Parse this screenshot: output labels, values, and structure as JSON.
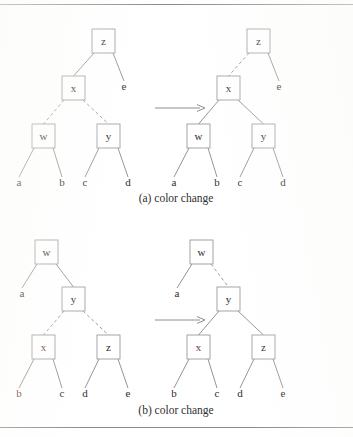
{
  "figure": {
    "rules": [
      {
        "name": "top-rule",
        "y": 4.5
      },
      {
        "name": "bottom-rule",
        "y": 427.5
      }
    ],
    "colors": {
      "page_background": "#ffffff",
      "box_stroke": "#9a9a9a",
      "box_fill": "#ffffff",
      "black_edge": "#8d8d8d",
      "red_edge": "#a08f8f",
      "label_text": "#2e2a2a",
      "red_label_text": "#6a3a38",
      "caption_text": "#2f2f2f",
      "rule_stroke": "#8a8a8a"
    },
    "box": {
      "width": 23,
      "height": 24
    },
    "arrow_glyph": "⟶"
  },
  "panels": [
    {
      "id": "panel-a",
      "caption": "(a) color change",
      "caption_x": 176,
      "caption_y": 202,
      "arrow": {
        "name": "transform-arrow-a",
        "x1": 155,
        "x2": 205,
        "y": 108
      },
      "trees": [
        {
          "id": "tree-a-before",
          "side": "before",
          "nodes": [
            {
              "label": "z",
              "x": 92,
              "y": 29,
              "red": false
            },
            {
              "label": "x",
              "x": 62,
              "y": 76,
              "red": false
            },
            {
              "label": "w",
              "x": 32,
              "y": 124,
              "red": false
            },
            {
              "label": "y",
              "x": 97,
              "y": 124,
              "red": false
            }
          ],
          "leaves": [
            {
              "label": "a",
              "x": 19,
              "y": 186,
              "red": false
            },
            {
              "label": "b",
              "x": 62,
              "y": 186,
              "red": false
            },
            {
              "label": "c",
              "x": 85,
              "y": 186,
              "red": false
            },
            {
              "label": "d",
              "x": 128,
              "y": 186,
              "red": false
            }
          ],
          "edges": [
            {
              "from": "z",
              "to": "x",
              "style": "solid"
            },
            {
              "from": "z",
              "to": "e",
              "style": "solid"
            },
            {
              "from": "x",
              "to": "w",
              "style": "dashed"
            },
            {
              "from": "x",
              "to": "y",
              "style": "dashed"
            },
            {
              "from": "w",
              "to": "a",
              "style": "solid"
            },
            {
              "from": "w",
              "to": "b",
              "style": "solid"
            },
            {
              "from": "y",
              "to": "c",
              "style": "solid"
            },
            {
              "from": "y",
              "to": "d",
              "style": "solid"
            }
          ],
          "extra_leaf": {
            "label": "e",
            "x": 124,
            "y": 90,
            "red": false
          }
        },
        {
          "id": "tree-a-after",
          "side": "after",
          "nodes": [
            {
              "label": "z",
              "x": 247,
              "y": 29,
              "red": false
            },
            {
              "label": "x",
              "x": 217,
              "y": 76,
              "red": false
            },
            {
              "label": "w",
              "x": 187,
              "y": 124,
              "red": false
            },
            {
              "label": "y",
              "x": 252,
              "y": 124,
              "red": false
            }
          ],
          "leaves": [
            {
              "label": "a",
              "x": 174,
              "y": 186,
              "red": false
            },
            {
              "label": "b",
              "x": 217,
              "y": 186,
              "red": false
            },
            {
              "label": "c",
              "x": 240,
              "y": 186,
              "red": false
            },
            {
              "label": "d",
              "x": 283,
              "y": 186,
              "red": false
            }
          ],
          "edges": [
            {
              "from": "z",
              "to": "x",
              "style": "dashed"
            },
            {
              "from": "z",
              "to": "e",
              "style": "solid"
            },
            {
              "from": "x",
              "to": "w",
              "style": "solid"
            },
            {
              "from": "x",
              "to": "y",
              "style": "solid"
            },
            {
              "from": "w",
              "to": "a",
              "style": "solid"
            },
            {
              "from": "w",
              "to": "b",
              "style": "solid"
            },
            {
              "from": "y",
              "to": "c",
              "style": "solid"
            },
            {
              "from": "y",
              "to": "d",
              "style": "solid"
            }
          ],
          "extra_leaf": {
            "label": "e",
            "x": 279,
            "y": 90,
            "red": false
          }
        }
      ]
    },
    {
      "id": "panel-b",
      "caption": "(b) color change",
      "caption_x": 176,
      "caption_y": 414,
      "arrow": {
        "name": "transform-arrow-b",
        "x1": 155,
        "x2": 205,
        "y": 320
      },
      "trees": [
        {
          "id": "tree-b-before",
          "side": "before",
          "nodes": [
            {
              "label": "w",
              "x": 35,
              "y": 240,
              "red": false
            },
            {
              "label": "y",
              "x": 62,
              "y": 287,
              "red": false
            },
            {
              "label": "x",
              "x": 32,
              "y": 335,
              "red": true
            },
            {
              "label": "z",
              "x": 97,
              "y": 335,
              "red": false
            }
          ],
          "leaves": [
            {
              "label": "a",
              "x": 22,
              "y": 297,
              "red": false
            },
            {
              "label": "b",
              "x": 19,
              "y": 397,
              "red": true
            },
            {
              "label": "c",
              "x": 62,
              "y": 397,
              "red": false
            },
            {
              "label": "d",
              "x": 85,
              "y": 397,
              "red": false
            },
            {
              "label": "e",
              "x": 128,
              "y": 397,
              "red": false
            }
          ],
          "edges": [
            {
              "from": "w",
              "to": "a",
              "style": "solid"
            },
            {
              "from": "w",
              "to": "y",
              "style": "solid"
            },
            {
              "from": "y",
              "to": "x",
              "style": "dashed"
            },
            {
              "from": "y",
              "to": "z",
              "style": "dashed"
            },
            {
              "from": "x",
              "to": "b",
              "style": "solid"
            },
            {
              "from": "x",
              "to": "c",
              "style": "solid"
            },
            {
              "from": "z",
              "to": "d",
              "style": "solid"
            },
            {
              "from": "z",
              "to": "e",
              "style": "solid"
            }
          ]
        },
        {
          "id": "tree-b-after",
          "side": "after",
          "nodes": [
            {
              "label": "w",
              "x": 190,
              "y": 240,
              "red": false
            },
            {
              "label": "y",
              "x": 217,
              "y": 287,
              "red": false
            },
            {
              "label": "x",
              "x": 187,
              "y": 335,
              "red": true
            },
            {
              "label": "z",
              "x": 252,
              "y": 335,
              "red": false
            }
          ],
          "leaves": [
            {
              "label": "a",
              "x": 177,
              "y": 297,
              "red": false
            },
            {
              "label": "b",
              "x": 174,
              "y": 397,
              "red": false
            },
            {
              "label": "c",
              "x": 217,
              "y": 397,
              "red": false
            },
            {
              "label": "d",
              "x": 240,
              "y": 397,
              "red": false
            },
            {
              "label": "e",
              "x": 283,
              "y": 397,
              "red": false
            }
          ],
          "edges": [
            {
              "from": "w",
              "to": "a",
              "style": "solid"
            },
            {
              "from": "w",
              "to": "y",
              "style": "dashed"
            },
            {
              "from": "y",
              "to": "x",
              "style": "solid"
            },
            {
              "from": "y",
              "to": "z",
              "style": "solid"
            },
            {
              "from": "x",
              "to": "b",
              "style": "solid"
            },
            {
              "from": "x",
              "to": "c",
              "style": "solid"
            },
            {
              "from": "z",
              "to": "d",
              "style": "solid"
            },
            {
              "from": "z",
              "to": "e",
              "style": "solid"
            }
          ]
        }
      ]
    }
  ]
}
